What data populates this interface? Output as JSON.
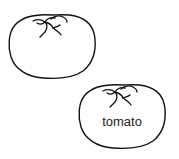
{
  "diagram": {
    "items": [
      {
        "id": "tomato-1",
        "icon": "tomato-icon",
        "label": ""
      },
      {
        "id": "tomato-2",
        "icon": "tomato-icon",
        "label": "tomato"
      }
    ]
  },
  "colors": {
    "stroke": "#111111",
    "fill": "#ffffff",
    "text": "#222222",
    "background": "#ffffff"
  }
}
